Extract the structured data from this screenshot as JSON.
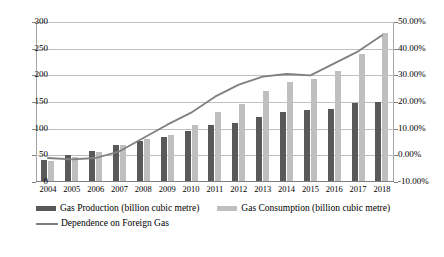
{
  "chart_data": {
    "type": "bar",
    "title": "",
    "subtitle": "",
    "xlabel": "",
    "ylabel": "",
    "categories": [
      "2004",
      "2005",
      "2006",
      "2007",
      "2008",
      "2009",
      "2010",
      "2011",
      "2012",
      "2013",
      "2014",
      "2015",
      "2016",
      "2017",
      "2018"
    ],
    "grid": true,
    "legend_position": "bottom-left",
    "axes": {
      "left": {
        "label": "",
        "min": 0,
        "max": 300,
        "step": 50,
        "ticks": [
          "0",
          "50",
          "100",
          "150",
          "200",
          "250",
          "300"
        ]
      },
      "right": {
        "label": "",
        "min": -10,
        "max": 50,
        "step": 10,
        "ticks": [
          "-10.00%",
          "0.00%",
          "10.00%",
          "20.00%",
          "30.00%",
          "40.00%",
          "50.00%"
        ]
      }
    },
    "series": [
      {
        "name": "Gas Production (billion cubic metre)",
        "type": "bar",
        "axis": "left",
        "color": "#595959",
        "values": [
          41,
          50,
          59,
          69,
          76,
          85,
          95,
          106,
          111,
          121,
          131,
          135,
          137,
          148,
          150
        ]
      },
      {
        "name": "Gas Consumption (billion cubic metre)",
        "type": "bar",
        "axis": "left",
        "color": "#bfbfbf",
        "values": [
          40,
          47,
          56,
          70,
          81,
          89,
          107,
          131,
          147,
          171,
          188,
          194,
          209,
          240,
          280
        ]
      },
      {
        "name": "Dependence on Foreign Gas",
        "type": "line",
        "axis": "right",
        "color": "#808080",
        "values": [
          -1.0,
          -1.5,
          -1.0,
          1.5,
          6.5,
          11.5,
          16.0,
          22.0,
          26.5,
          29.5,
          30.5,
          30.0,
          34.5,
          39.0,
          45.0
        ]
      }
    ]
  }
}
